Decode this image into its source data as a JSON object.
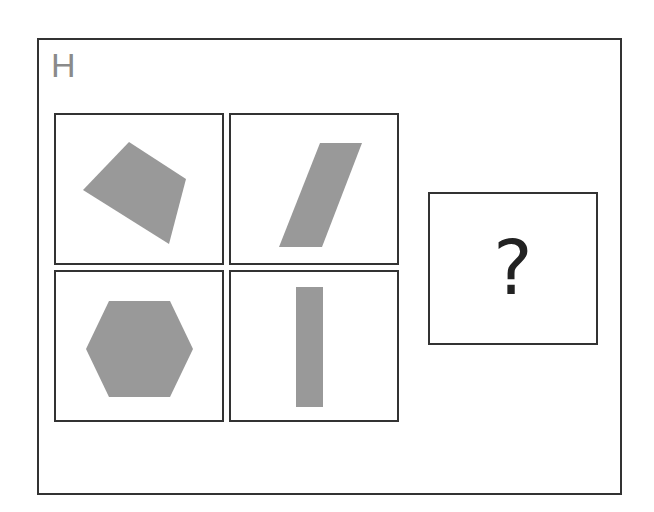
{
  "puzzle": {
    "label": "H",
    "question_mark": "?",
    "shape_color": "#999999",
    "border_color": "#333333",
    "panels": [
      {
        "position": "top-left",
        "shape": "irregular-quadrilateral"
      },
      {
        "position": "top-right",
        "shape": "parallelogram"
      },
      {
        "position": "bottom-left",
        "shape": "hexagon"
      },
      {
        "position": "bottom-right",
        "shape": "rectangle"
      }
    ]
  }
}
